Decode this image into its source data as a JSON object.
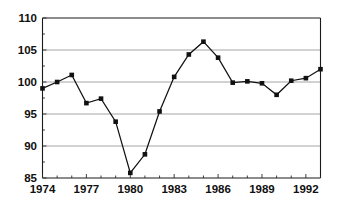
{
  "chart_data": {
    "type": "line",
    "title": "",
    "subtitle": "",
    "xlabel": "",
    "ylabel": "",
    "x": [
      1974,
      1975,
      1976,
      1977,
      1978,
      1979,
      1980,
      1981,
      1982,
      1983,
      1984,
      1985,
      1986,
      1987,
      1988,
      1989,
      1990,
      1991,
      1992,
      1993
    ],
    "values": [
      99.0,
      100.0,
      101.1,
      96.7,
      97.4,
      93.8,
      85.8,
      88.7,
      95.4,
      100.8,
      104.3,
      106.3,
      103.8,
      99.9,
      100.1,
      99.8,
      98.0,
      100.2,
      100.6,
      102.0
    ],
    "series": [
      {
        "name": "index",
        "values": [
          99.0,
          100.0,
          101.1,
          96.7,
          97.4,
          93.8,
          85.8,
          88.7,
          95.4,
          100.8,
          104.3,
          106.3,
          103.8,
          99.9,
          100.1,
          99.8,
          98.0,
          100.2,
          100.6,
          102.0
        ]
      }
    ],
    "ylim": [
      85,
      110
    ],
    "xlim": [
      1974,
      1993
    ],
    "ytick_labels": [
      "110",
      "105",
      "100",
      "95",
      "90",
      "85"
    ],
    "ytick_values": [
      110,
      105,
      100,
      95,
      90,
      85
    ],
    "ytick_minor_values": [
      107.5,
      102.5,
      97.5,
      92.5,
      87.5
    ],
    "xtick_labels": [
      "1974",
      "1977",
      "1980",
      "1983",
      "1986",
      "1989",
      "1992"
    ],
    "xtick_values": [
      1974,
      1977,
      1980,
      1983,
      1986,
      1989,
      1992
    ],
    "xtick_minor_values": [
      1975,
      1976,
      1978,
      1979,
      1981,
      1982,
      1984,
      1985,
      1987,
      1988,
      1990,
      1991,
      1993
    ],
    "grid": "horizontal",
    "legend": "none",
    "marker": "square",
    "line_color": "#111111",
    "marker_color": "#111111",
    "grid_color": "#9a9a9a",
    "axis_color": "#1a1a1a",
    "background_color": "#ffffff",
    "annotations": []
  }
}
